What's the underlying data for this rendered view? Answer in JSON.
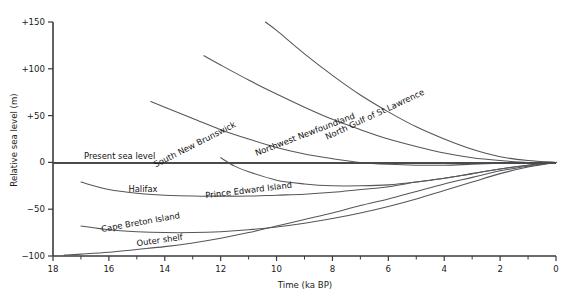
{
  "chart_data": {
    "type": "line",
    "title": "",
    "xlabel": "Time (ka BP)",
    "ylabel": "Relative sea level (m)",
    "xlim": [
      18,
      0
    ],
    "ylim": [
      -100,
      150
    ],
    "x_ticklabels": [
      "18",
      "16",
      "14",
      "12",
      "10",
      "8",
      "6",
      "4",
      "2",
      "0"
    ],
    "x_tickvalues": [
      18,
      16,
      14,
      12,
      10,
      8,
      6,
      4,
      2,
      0
    ],
    "x_minor_step": 1,
    "y_ticklabels": [
      "+150",
      "+100",
      "+50",
      "0",
      "−50",
      "−100"
    ],
    "y_tickvalues": [
      150,
      100,
      50,
      0,
      -50,
      -100
    ],
    "grid": false,
    "legend": "inline-curve-labels",
    "reference_line": {
      "label": "Present sea level",
      "value": 0,
      "color": "#4a4a4d"
    },
    "series": [
      {
        "name": "North Gulf of St Lawrence",
        "label": "North Gulf of St Lawrence",
        "color": "#55555a",
        "x": [
          10.4,
          10.0,
          9.0,
          8.0,
          7.0,
          6.0,
          5.0,
          4.0,
          3.0,
          2.0,
          1.0,
          0.0
        ],
        "y": [
          150,
          141,
          116,
          93,
          72,
          54,
          38,
          25,
          14,
          6,
          2,
          0
        ]
      },
      {
        "name": "Northwest Newfoundland",
        "label": "Northwest Newfoundland",
        "color": "#55555a",
        "x": [
          12.6,
          12.0,
          11.0,
          10.0,
          9.0,
          8.0,
          7.0,
          6.0,
          5.0,
          4.0,
          3.0,
          2.0,
          1.0,
          0.0
        ],
        "y": [
          114,
          104,
          88,
          73,
          59,
          46,
          35,
          25,
          17,
          10,
          5,
          2,
          0,
          0
        ]
      },
      {
        "name": "South New Brunswick",
        "label": "South New Brunswick",
        "color": "#55555a",
        "x": [
          14.5,
          14.0,
          13.0,
          12.0,
          11.0,
          10.0,
          9.0,
          8.0,
          7.0,
          6.0,
          5.0,
          4.0,
          3.0,
          2.0,
          1.0,
          0.0
        ],
        "y": [
          65,
          59,
          47,
          35,
          25,
          16,
          9,
          4,
          0,
          -2,
          -3,
          -3,
          -2,
          -1,
          0,
          0
        ]
      },
      {
        "name": "Prince Edward Island",
        "label": "Prince Edward Island",
        "color": "#55555a",
        "x": [
          12.0,
          11.5,
          11.0,
          10.0,
          9.0,
          8.0,
          7.0,
          6.0,
          5.0,
          4.0,
          3.0,
          2.0,
          1.0,
          0.0
        ],
        "y": [
          5,
          -4,
          -10,
          -19,
          -23,
          -25,
          -25,
          -24,
          -21,
          -17,
          -12,
          -7,
          -3,
          0
        ]
      },
      {
        "name": "Halifax",
        "label": "Halifax",
        "color": "#55555a",
        "x": [
          17.0,
          16.0,
          15.0,
          14.0,
          13.0,
          12.0,
          11.0,
          10.0,
          9.0,
          8.0,
          7.0,
          6.0,
          5.0,
          4.0,
          3.0,
          2.0,
          1.0,
          0.0
        ],
        "y": [
          -21,
          -29,
          -33,
          -35,
          -36,
          -36,
          -36,
          -35,
          -34,
          -32,
          -29,
          -26,
          -21,
          -17,
          -12,
          -7,
          -3,
          0
        ]
      },
      {
        "name": "Cape Breton Island",
        "label": "Cape Breton Island",
        "color": "#55555a",
        "x": [
          17.0,
          16.0,
          15.0,
          14.0,
          13.0,
          12.0,
          11.0,
          10.0,
          9.0,
          8.0,
          7.0,
          6.0,
          5.0,
          4.0,
          3.0,
          2.0,
          1.0,
          0.0
        ],
        "y": [
          -68,
          -72,
          -74,
          -75,
          -75,
          -74,
          -72,
          -69,
          -65,
          -60,
          -54,
          -47,
          -39,
          -30,
          -21,
          -12,
          -5,
          0
        ]
      },
      {
        "name": "Outer shelf",
        "label": "Outer shelf",
        "color": "#55555a",
        "x": [
          17.6,
          17.0,
          16.0,
          15.0,
          14.0,
          13.0,
          12.0,
          11.0,
          10.0,
          9.0,
          8.0,
          7.0,
          6.0,
          5.0,
          4.0,
          3.0,
          2.0,
          1.0,
          0.0
        ],
        "y": [
          -99,
          -98,
          -96,
          -93,
          -90,
          -86,
          -81,
          -75,
          -68,
          -61,
          -54,
          -46,
          -39,
          -31,
          -23,
          -16,
          -9,
          -4,
          0
        ]
      }
    ],
    "curve_labels": [
      {
        "text": "North Gulf of St Lawrence",
        "x": 376,
        "y": 117,
        "rotate": -25
      },
      {
        "text": "Northwest Newfoundland",
        "x": 306,
        "y": 137,
        "rotate": -21
      },
      {
        "text": "South New Brunswick",
        "x": 196,
        "y": 147,
        "rotate": -27
      },
      {
        "text": "Prince Edward Island",
        "x": 249,
        "y": 193,
        "rotate": -7
      },
      {
        "text": "Halifax",
        "x": 143,
        "y": 192,
        "rotate": 0
      },
      {
        "text": "Cape Breton Island",
        "x": 141,
        "y": 225,
        "rotate": -10
      },
      {
        "text": "Outer shelf",
        "x": 160,
        "y": 243,
        "rotate": -8
      }
    ]
  }
}
